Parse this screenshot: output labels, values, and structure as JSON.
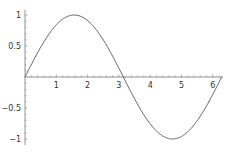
{
  "chart_data": {
    "type": "line",
    "title": "",
    "xlabel": "",
    "ylabel": "",
    "function": "sin(x)",
    "xlim": [
      0,
      6.283
    ],
    "ylim": [
      -1,
      1
    ],
    "grid": false,
    "legend": null,
    "x_ticks": [
      1,
      2,
      3,
      4,
      5,
      6
    ],
    "x_tick_labels": [
      "1",
      "2",
      "3",
      "4",
      "5",
      "6"
    ],
    "y_ticks": [
      -1,
      -0.5,
      0.5,
      1
    ],
    "y_tick_labels": [
      "−1",
      "−0.5",
      "0.5",
      "1"
    ],
    "series": [
      {
        "name": "sin(x)",
        "color": "#555555",
        "x": [
          0,
          0.5,
          1,
          1.5708,
          2,
          2.5,
          3,
          3.1416,
          3.5,
          4,
          4.7124,
          5,
          5.5,
          6,
          6.2832
        ],
        "y": [
          0,
          0.479,
          0.841,
          1,
          0.909,
          0.598,
          0.141,
          0,
          -0.351,
          -0.757,
          -1,
          -0.959,
          -0.706,
          -0.279,
          0
        ]
      }
    ]
  },
  "style": {
    "axis_color": "#777777",
    "line_color": "#555555"
  }
}
